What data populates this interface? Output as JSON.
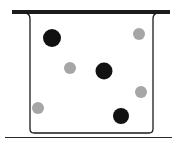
{
  "diagram": {
    "colors": {
      "outline": "#1a1a1a",
      "lid": "#1c1c1c",
      "dark_particle": "#111111",
      "light_particle": "#a6a6a6",
      "ground": "#2a2a2a",
      "background": "#ffffff"
    },
    "dark_particles": [
      {
        "cx": 52,
        "cy": 38,
        "r": 9
      },
      {
        "cx": 104,
        "cy": 71,
        "r": 8.5
      },
      {
        "cx": 121,
        "cy": 116,
        "r": 8
      }
    ],
    "light_particles": [
      {
        "cx": 139,
        "cy": 34,
        "r": 6
      },
      {
        "cx": 70,
        "cy": 68,
        "r": 6
      },
      {
        "cx": 141,
        "cy": 92,
        "r": 6
      },
      {
        "cx": 38,
        "cy": 108,
        "r": 6
      }
    ]
  }
}
